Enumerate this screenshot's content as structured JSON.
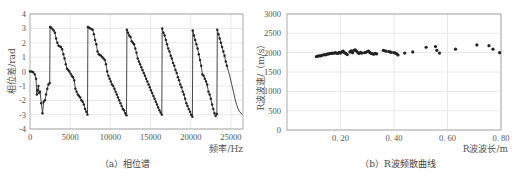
{
  "chart_data": [
    {
      "type": "line",
      "title": "",
      "caption": "（a）相位谱",
      "xlabel": "频率/Hz",
      "ylabel": "相位差/rad",
      "xlim": [
        0,
        26500
      ],
      "ylim": [
        -4,
        4
      ],
      "xticks": [
        0,
        5000,
        10000,
        15000,
        20000,
        25000
      ],
      "xtick_labels": [
        "0",
        "5000",
        "10000",
        "15000",
        "20000",
        "25000"
      ],
      "yticks": [
        -4,
        -3,
        -2,
        -1,
        0,
        1,
        2,
        3,
        4
      ],
      "ytick_labels": [
        "-4",
        "-3",
        "-2",
        "-1",
        "0",
        "1",
        "2",
        "3",
        "4"
      ],
      "grid": true,
      "markers": true,
      "series": [
        {
          "name": "phase",
          "x": [
            0,
            200,
            400,
            600,
            750,
            850,
            950,
            1050,
            1150,
            1250,
            1400,
            1550,
            1700,
            1850,
            2000,
            2150,
            2300,
            2450,
            2500,
            2650,
            2800,
            2950,
            3100,
            3250,
            3400,
            3550,
            3700,
            3850,
            4000,
            4150,
            4300,
            4450,
            4600,
            4750,
            4900,
            5050,
            5200,
            5350,
            5500,
            5650,
            5800,
            5950,
            6100,
            6250,
            6400,
            6550,
            6700,
            6850,
            7000,
            7150,
            7200,
            7350,
            7500,
            7650,
            7800,
            7950,
            8100,
            8250,
            8400,
            8550,
            8700,
            8850,
            9000,
            9150,
            9300,
            9450,
            9600,
            9750,
            9900,
            10050,
            10200,
            10350,
            10500,
            10650,
            10800,
            10950,
            11100,
            11250,
            11400,
            11550,
            11700,
            11850,
            12000,
            12050,
            12200,
            12350,
            12500,
            12650,
            12800,
            12950,
            13100,
            13250,
            13400,
            13550,
            13700,
            13850,
            14000,
            14150,
            14300,
            14450,
            14600,
            14750,
            14900,
            15050,
            15200,
            15350,
            15500,
            15650,
            15800,
            15950,
            16100,
            16250,
            16400,
            16450,
            16600,
            16750,
            16900,
            17050,
            17200,
            17350,
            17500,
            17650,
            17800,
            17950,
            18100,
            18250,
            18400,
            18550,
            18700,
            18850,
            19000,
            19150,
            19300,
            19450,
            19600,
            19750,
            19900,
            20050,
            20200,
            20250,
            20400,
            20550,
            20700,
            20850,
            21000,
            21150,
            21300,
            21450,
            21600,
            21750,
            21900,
            22050,
            22200,
            22350,
            22500,
            22650,
            22800,
            22950,
            23100,
            23250,
            23300,
            23450,
            23600,
            23750,
            23900,
            24050,
            24200,
            24350,
            24500,
            24700,
            24900,
            25100,
            25300,
            25500,
            25700,
            25900,
            26100,
            26400
          ],
          "y": [
            0,
            0,
            -0.05,
            -0.2,
            -0.5,
            -1.6,
            -1.3,
            -1.0,
            -1.5,
            -1.4,
            -2.2,
            -2.9,
            -2.1,
            -2.0,
            -1.6,
            -1.2,
            -0.9,
            -0.8,
            3.1,
            3.05,
            2.95,
            2.85,
            2.7,
            2.3,
            2.0,
            1.8,
            1.75,
            1.7,
            1.55,
            1.2,
            0.9,
            0.5,
            0.2,
            0.1,
            0.0,
            -0.15,
            -0.3,
            -0.4,
            -0.6,
            -1.2,
            -1.4,
            -1.6,
            -1.7,
            -1.8,
            -2.0,
            -2.1,
            -2.3,
            -2.6,
            -2.8,
            -3.0,
            3.1,
            3.05,
            3.0,
            2.95,
            2.9,
            2.6,
            2.2,
            1.9,
            1.4,
            1.2,
            1.15,
            1.1,
            1.0,
            0.9,
            0.8,
            0.5,
            0.0,
            -0.3,
            -0.5,
            -0.7,
            -0.9,
            -1.0,
            -1.2,
            -1.4,
            -1.6,
            -1.8,
            -2.0,
            -2.2,
            -2.4,
            -2.6,
            -2.7,
            -2.9,
            -3.05,
            2.9,
            2.7,
            2.5,
            2.4,
            2.1,
            2.0,
            1.9,
            1.6,
            1.3,
            0.9,
            0.7,
            0.5,
            0.3,
            0.1,
            -0.1,
            -0.3,
            -0.5,
            -0.7,
            -0.9,
            -1.1,
            -1.3,
            -1.5,
            -1.7,
            -1.9,
            -2.1,
            -2.3,
            -2.5,
            -2.7,
            -2.85,
            -3.0,
            3.0,
            2.7,
            2.5,
            2.2,
            1.9,
            1.6,
            1.4,
            1.1,
            0.9,
            0.6,
            0.4,
            0.1,
            -0.1,
            -0.4,
            -0.6,
            -0.9,
            -1.1,
            -1.4,
            -1.6,
            -1.9,
            -2.2,
            -2.4,
            -2.6,
            -2.8,
            -3.0,
            -3.15,
            2.85,
            2.5,
            2.2,
            1.9,
            1.6,
            1.2,
            0.8,
            0.4,
            -0.2,
            -0.3,
            -0.5,
            -0.7,
            -0.9,
            -1.4,
            -1.6,
            -1.9,
            -2.3,
            -2.6,
            -2.9,
            -3.1,
            -2.95,
            2.9,
            2.6,
            2.3,
            2.0,
            1.7,
            1.4,
            1.1,
            0.7,
            0.4,
            0.0,
            -0.4,
            -0.9,
            -1.4,
            -1.9,
            -2.3,
            -2.6,
            -2.8,
            -3.0
          ]
        }
      ]
    },
    {
      "type": "scatter",
      "title": "",
      "caption": "（b）R波频散曲线",
      "xlabel": "R波波长/m",
      "ylabel": "R波波速/（m/s）",
      "xlim": [
        0,
        0.8
      ],
      "ylim": [
        0,
        3000
      ],
      "xticks": [
        0.2,
        0.4,
        0.6,
        0.8
      ],
      "xtick_labels": [
        "0. 20",
        "0. 40",
        "0. 60",
        "0. 80"
      ],
      "yticks": [
        0,
        500,
        1000,
        1500,
        2000,
        2500,
        3000
      ],
      "ytick_labels": [
        "0",
        "500",
        "1000",
        "1500",
        "2000",
        "2500",
        "3000"
      ],
      "grid": true,
      "series": [
        {
          "name": "R-wave dispersion",
          "x": [
            0.11,
            0.115,
            0.12,
            0.125,
            0.13,
            0.135,
            0.14,
            0.145,
            0.15,
            0.155,
            0.16,
            0.165,
            0.17,
            0.175,
            0.18,
            0.185,
            0.19,
            0.195,
            0.2,
            0.205,
            0.21,
            0.215,
            0.22,
            0.225,
            0.235,
            0.24,
            0.245,
            0.25,
            0.255,
            0.26,
            0.265,
            0.27,
            0.275,
            0.28,
            0.29,
            0.295,
            0.3,
            0.305,
            0.31,
            0.315,
            0.32,
            0.325,
            0.33,
            0.335,
            0.36,
            0.365,
            0.37,
            0.38,
            0.385,
            0.39,
            0.4,
            0.405,
            0.41,
            0.415,
            0.44,
            0.47,
            0.52,
            0.555,
            0.56,
            0.57,
            0.63,
            0.71,
            0.755,
            0.77,
            0.795
          ],
          "y": [
            1900,
            1910,
            1920,
            1915,
            1930,
            1940,
            1950,
            1945,
            1960,
            1970,
            1975,
            1980,
            1990,
            1985,
            2000,
            1990,
            1980,
            2010,
            1990,
            2020,
            2040,
            2000,
            1980,
            1950,
            2020,
            2050,
            2000,
            2060,
            2070,
            2040,
            2000,
            1980,
            2010,
            1990,
            2000,
            2010,
            2030,
            2040,
            2000,
            1980,
            1970,
            1960,
            1980,
            1970,
            2060,
            2050,
            2040,
            2030,
            2020,
            2010,
            2000,
            1990,
            1970,
            1940,
            1990,
            2020,
            2140,
            2160,
            2060,
            1990,
            2090,
            2200,
            2180,
            2090,
            2000
          ]
        }
      ]
    }
  ]
}
